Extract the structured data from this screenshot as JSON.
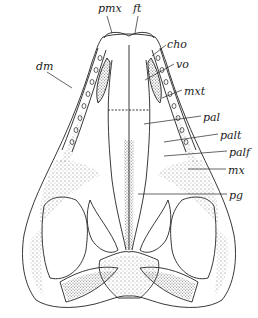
{
  "figure": {
    "line_color": "#222222",
    "stipple_color": "#555555",
    "background": "#ffffff"
  },
  "labels": [
    {
      "id": "pmx",
      "text": "pmx",
      "x": 98,
      "y": 3
    },
    {
      "id": "ft",
      "text": "ft",
      "x": 133,
      "y": 3
    },
    {
      "id": "cho",
      "text": "cho",
      "x": 167,
      "y": 39
    },
    {
      "id": "vo",
      "text": "vo",
      "x": 176,
      "y": 59
    },
    {
      "id": "dm",
      "text": "dm",
      "x": 36,
      "y": 61
    },
    {
      "id": "mxt",
      "text": "mxt",
      "x": 184,
      "y": 86
    },
    {
      "id": "pal",
      "text": "pal",
      "x": 203,
      "y": 112
    },
    {
      "id": "palt",
      "text": "palt",
      "x": 220,
      "y": 130
    },
    {
      "id": "palf",
      "text": "palf",
      "x": 229,
      "y": 147
    },
    {
      "id": "mx",
      "text": "mx",
      "x": 228,
      "y": 165
    },
    {
      "id": "pg",
      "text": "pg",
      "x": 229,
      "y": 190
    }
  ]
}
